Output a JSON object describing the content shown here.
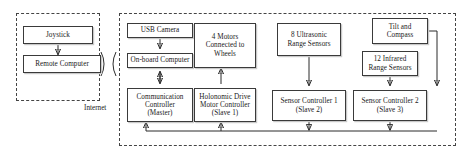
{
  "diagram": {
    "groups": [
      {
        "name": "remote-side-group",
        "label": ""
      },
      {
        "name": "robot-side-group",
        "label": ""
      }
    ],
    "captions": {
      "internet": "Internet"
    },
    "nodes": {
      "joystick": "Joystick",
      "remote_computer": "Remote Computer",
      "usb_camera": "USB Camera",
      "onboard_computer": "On-board Computer",
      "communication_controller": "Communication\nController\n(Master)",
      "motors": "4 Motors\nConnected to\nWheels",
      "motor_controller": "Holonomic Drive\nMotor Controller\n(Slave 1)",
      "ultrasonic_sensors": "8 Ultrasonic\nRange Sensors",
      "sensor_controller_1": "Sensor Controller 1\n(Slave 2)",
      "tilt_compass": "Tilt and\nCompass",
      "infrared_sensors": "12 Infrared\nRange Sensors",
      "sensor_controller_2": "Sensor Controller 2\n(Slave 3)"
    },
    "colors": {
      "box_border": "#3a3a3a",
      "group_border": "#444444",
      "wire": "#2b2b2b",
      "text": "#1a1a1a",
      "background": "#ffffff"
    }
  }
}
